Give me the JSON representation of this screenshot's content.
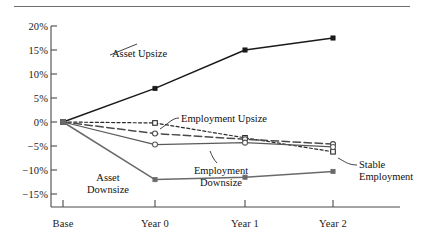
{
  "chart_data": {
    "type": "line",
    "title": "",
    "subtitle": "",
    "xlabel": "",
    "ylabel": "",
    "categories": [
      "Base",
      "Year 0",
      "Year 1",
      "Year 2"
    ],
    "x_tick_labels": [
      "Base",
      "Year 0",
      "Year 1",
      "Year 2"
    ],
    "y_tick_labels": [
      "20%",
      "15%",
      "10%",
      "5%",
      "0%",
      "−5%",
      "−10%",
      "−15%"
    ],
    "y_tick_values": [
      20,
      15,
      10,
      5,
      0,
      -5,
      -10,
      -15
    ],
    "ylim": [
      -15,
      20
    ],
    "y_unit": "percent",
    "grid": false,
    "legend": "none",
    "legend_position": "inline-annotations",
    "series": [
      {
        "name": "Asset Upsize",
        "values": [
          0,
          7.0,
          15.0,
          17.5
        ],
        "line_style": "solid",
        "color": "#1a1a1a",
        "marker": "filled-square"
      },
      {
        "name": "Employment Upsize",
        "values": [
          0,
          -0.2,
          -3.3,
          -6.2
        ],
        "line_style": "dashed",
        "color": "#2b2b2b",
        "marker": "open-square"
      },
      {
        "name": "Stable Employment",
        "values": [
          0,
          -2.4,
          -3.6,
          -4.6
        ],
        "line_style": "long-dash",
        "color": "#4a4a4a",
        "marker": "open-circle"
      },
      {
        "name": "Employment Downsize",
        "values": [
          0,
          -4.7,
          -4.3,
          -5.2
        ],
        "line_style": "solid",
        "color": "#5a5a5a",
        "marker": "open-circle"
      },
      {
        "name": "Asset Downsize",
        "values": [
          0,
          -12.0,
          -11.5,
          -10.3
        ],
        "line_style": "solid",
        "color": "#6a6a6a",
        "marker": "filled-square"
      }
    ],
    "annotations": [
      {
        "text": "Asset Upsize",
        "series": "Asset Upsize",
        "leader": false
      },
      {
        "text": "Asset Downsize",
        "series": "Asset Downsize",
        "leader": false,
        "lines": [
          "Asset",
          "Downsize"
        ]
      },
      {
        "text": "Employment Upsize",
        "series": "Employment Upsize",
        "leader": true
      },
      {
        "text": "Employment Downsize",
        "series": "Employment Downsize",
        "leader": true,
        "lines": [
          "Employment",
          "Downsize"
        ]
      },
      {
        "text": "Stable Employment",
        "series": "Stable Employment",
        "leader": true,
        "lines": [
          "Stable",
          "Employment"
        ]
      }
    ]
  },
  "axis": {
    "y": {
      "t0": "20%",
      "t1": "15%",
      "t2": "10%",
      "t3": "5%",
      "t4": "0%",
      "t5": "−5%",
      "t6": "−10%",
      "t7": "−15%"
    },
    "x": {
      "t0": "Base",
      "t1": "Year 0",
      "t2": "Year 1",
      "t3": "Year 2"
    }
  },
  "labels": {
    "asset_upsize": "Asset Upsize",
    "employment_upsize": "Employment Upsize",
    "stable_employment_line1": "Stable",
    "stable_employment_line2": "Employment",
    "employment_downsize_line1": "Employment",
    "employment_downsize_line2": "Downsize",
    "asset_downsize_line1": "Asset",
    "asset_downsize_line2": "Downsize"
  }
}
